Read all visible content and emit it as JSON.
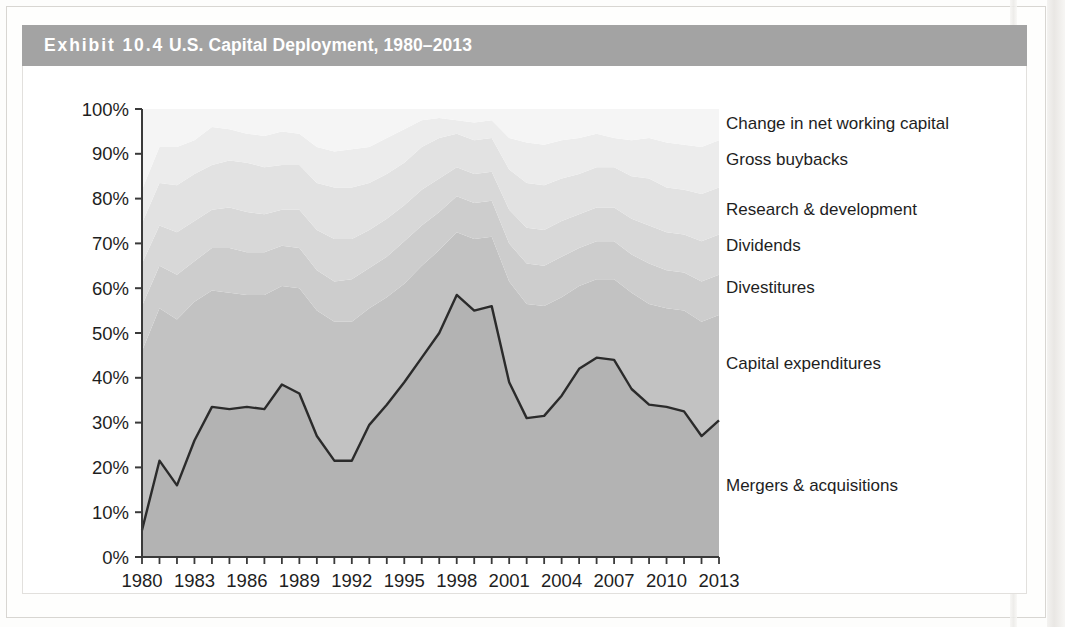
{
  "exhibit": {
    "number_label": "Exhibit 10.4",
    "title": "U.S. Capital Deployment, 1980–2013"
  },
  "colors": {
    "title_bar": "#a3a3a3",
    "title_text": "#ffffff",
    "axis": "#3a3a3a",
    "tick_label": "#1e1e1e",
    "legend_text": "#1e1e1e",
    "ma_line": "#2b2b2b",
    "series_fills": [
      "#b3b3b3",
      "#c2c2c2",
      "#cdcdcd",
      "#d8d8d8",
      "#e2e2e2",
      "#ececec",
      "#f5f5f5"
    ]
  },
  "legend": {
    "items": [
      {
        "label": "Change in net working capital",
        "y": 48
      },
      {
        "label": "Gross buybacks",
        "y": 84
      },
      {
        "label": "Research & development",
        "y": 134
      },
      {
        "label": "Dividends",
        "y": 170
      },
      {
        "label": "Divestitures",
        "y": 212
      },
      {
        "label": "Capital expenditures",
        "y": 288
      },
      {
        "label": "Mergers & acquisitions",
        "y": 410
      }
    ]
  },
  "chart_data": {
    "type": "area",
    "stacked": true,
    "stack_total": 100,
    "title": "U.S. Capital Deployment, 1980–2013",
    "xlabel": "",
    "ylabel": "",
    "ylim": [
      0,
      100
    ],
    "ytick_values": [
      0,
      10,
      20,
      30,
      40,
      50,
      60,
      70,
      80,
      90,
      100
    ],
    "ytick_labels": [
      "0%",
      "10%",
      "20%",
      "30%",
      "40%",
      "50%",
      "60%",
      "70%",
      "80%",
      "90%",
      "100%"
    ],
    "xlim": [
      1980,
      2013
    ],
    "xtick_labels": [
      "1980",
      "1983",
      "1986",
      "1989",
      "1992",
      "1995",
      "1998",
      "2001",
      "2004",
      "2007",
      "2010",
      "2013"
    ],
    "xtick_step": 3,
    "minor_ticks_every": 1,
    "grid": false,
    "legend_position": "right-inline",
    "x": [
      1980,
      1981,
      1982,
      1983,
      1984,
      1985,
      1986,
      1987,
      1988,
      1989,
      1990,
      1991,
      1992,
      1993,
      1994,
      1995,
      1996,
      1997,
      1998,
      1999,
      2000,
      2001,
      2002,
      2003,
      2004,
      2005,
      2006,
      2007,
      2008,
      2009,
      2010,
      2011,
      2012,
      2013
    ],
    "series": [
      {
        "name": "Mergers & acquisitions",
        "fill": "#b3b3b3",
        "outline": true,
        "values": [
          6,
          21.5,
          16,
          26,
          33.5,
          33,
          33.5,
          33,
          38.5,
          36.5,
          27,
          21.5,
          21.5,
          29.5,
          34,
          39,
          44.5,
          50,
          58.5,
          55,
          56,
          39,
          31,
          31.5,
          36,
          42,
          44.5,
          44,
          37.5,
          34,
          33.5,
          32.5,
          27,
          30.5
        ]
      },
      {
        "name": "Capital expenditures",
        "fill": "#c2c2c2",
        "values": [
          40,
          34,
          37,
          31,
          26,
          26,
          25,
          25.5,
          22,
          23.5,
          28,
          31,
          31,
          26,
          24,
          22,
          20.5,
          18.5,
          14,
          16,
          15.5,
          22.5,
          25.5,
          24.5,
          22,
          18.5,
          17.5,
          18,
          21.5,
          22.5,
          22,
          22.5,
          25.5,
          23.5
        ]
      },
      {
        "name": "Divestitures",
        "fill": "#cdcdcd",
        "values": [
          10,
          9.5,
          10,
          9,
          9.5,
          10,
          9.5,
          9.5,
          9,
          9,
          9,
          9,
          9.5,
          9,
          9,
          9.5,
          9,
          8.5,
          8,
          8,
          8,
          8.5,
          9,
          9,
          9,
          8.5,
          8.5,
          8.5,
          8.5,
          9,
          8.5,
          8.5,
          9,
          9
        ]
      },
      {
        "name": "Dividends",
        "fill": "#d8d8d8",
        "values": [
          9.5,
          9,
          9.5,
          9,
          8.5,
          9,
          9,
          8.5,
          8,
          8.5,
          9,
          9.5,
          9,
          8.5,
          8.5,
          8,
          8,
          7.5,
          6.5,
          6.5,
          6.5,
          7.5,
          8,
          8,
          8,
          7.5,
          7.5,
          7.5,
          8,
          8.5,
          8.5,
          8.5,
          9,
          9
        ]
      },
      {
        "name": "Research & development",
        "fill": "#e2e2e2",
        "values": [
          9,
          9.5,
          10.5,
          10.5,
          10,
          10.5,
          11,
          10.5,
          10,
          10,
          10.5,
          11.5,
          11.5,
          10.5,
          10,
          9.5,
          9.5,
          9,
          7.5,
          7.5,
          7.5,
          9,
          10,
          10,
          9.5,
          9,
          9,
          9,
          9.5,
          10.5,
          10,
          10,
          10.5,
          10.5
        ]
      },
      {
        "name": "Gross buybacks",
        "fill": "#ececec",
        "values": [
          7.5,
          8,
          8.5,
          7.5,
          8.5,
          7,
          6.5,
          7,
          7.5,
          7,
          8,
          8,
          8.5,
          8,
          8,
          7.5,
          6,
          4.5,
          3,
          4,
          4,
          7,
          9,
          9,
          8.5,
          8,
          7.5,
          6.5,
          8,
          9,
          10,
          10,
          10.5,
          10.5
        ]
      },
      {
        "name": "Change in net working capital",
        "fill": "#f5f5f5",
        "values": [
          18,
          8.5,
          8.5,
          7,
          4,
          4.5,
          5.5,
          6,
          5,
          5.5,
          8.5,
          9.5,
          9,
          8.5,
          6.5,
          4.5,
          2.5,
          2,
          2.5,
          3,
          2.5,
          6.5,
          7.5,
          8,
          7,
          6.5,
          5.5,
          6.5,
          7,
          6.5,
          7.5,
          8,
          8.5,
          7
        ]
      }
    ]
  }
}
